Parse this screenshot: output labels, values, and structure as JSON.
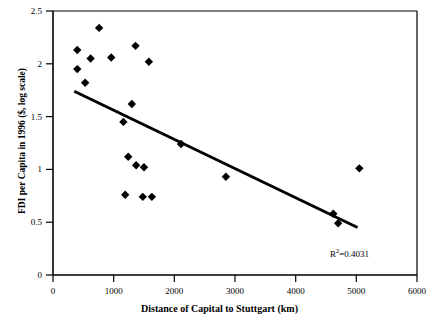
{
  "chart_data": {
    "type": "scatter",
    "title": "",
    "xlabel": "Distance of Capital to Stuttgart (km)",
    "ylabel": "FDI per Capita in 1996 ($, log scale)",
    "xlim": [
      0,
      6000
    ],
    "ylim": [
      0,
      2.5
    ],
    "xticks": [
      0,
      1000,
      2000,
      3000,
      4000,
      5000,
      6000
    ],
    "yticks": [
      0,
      0.5,
      1,
      1.5,
      2,
      2.5
    ],
    "xtick_labels": [
      "0",
      "1000",
      "2000",
      "3000",
      "4000",
      "5000",
      "6000"
    ],
    "ytick_labels": [
      "0",
      "0.5",
      "1",
      "1.5",
      "2",
      "2.5"
    ],
    "grid": false,
    "legend": null,
    "marker": "filled-diamond",
    "marker_color": "#000000",
    "points": [
      {
        "x": 400,
        "y": 2.13
      },
      {
        "x": 400,
        "y": 1.95
      },
      {
        "x": 620,
        "y": 2.05
      },
      {
        "x": 530,
        "y": 1.82
      },
      {
        "x": 760,
        "y": 2.34
      },
      {
        "x": 960,
        "y": 2.06
      },
      {
        "x": 1360,
        "y": 2.17
      },
      {
        "x": 1580,
        "y": 2.02
      },
      {
        "x": 1160,
        "y": 1.45
      },
      {
        "x": 1300,
        "y": 1.62
      },
      {
        "x": 1240,
        "y": 1.12
      },
      {
        "x": 1370,
        "y": 1.04
      },
      {
        "x": 1500,
        "y": 1.02
      },
      {
        "x": 1190,
        "y": 0.76
      },
      {
        "x": 1480,
        "y": 0.74
      },
      {
        "x": 1630,
        "y": 0.74
      },
      {
        "x": 2110,
        "y": 1.24
      },
      {
        "x": 2850,
        "y": 0.93
      },
      {
        "x": 4620,
        "y": 0.58
      },
      {
        "x": 4700,
        "y": 0.49
      },
      {
        "x": 5050,
        "y": 1.01
      }
    ],
    "trendline": {
      "x_start": 350,
      "y_start": 1.74,
      "x_end": 5020,
      "y_end": 0.45,
      "color": "#000000",
      "width": 3
    },
    "annotations": [
      {
        "name": "r-squared",
        "text_prefix": "R",
        "text_sup": "2",
        "text_suffix": "=0.4031",
        "x": 5000,
        "y": 0.32
      }
    ]
  },
  "axis": {
    "x_title": "Distance of Capital to Stuttgart (km)",
    "y_title": "FDI per Capita in 1996 ($, log scale)"
  },
  "r2": {
    "prefix": "R",
    "sup": "2",
    "suffix": "=0.4031"
  }
}
